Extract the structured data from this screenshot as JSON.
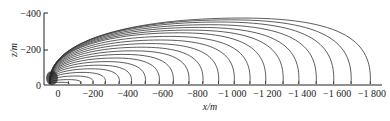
{
  "chart_data": {
    "type": "line",
    "title": "",
    "xlabel": "x/m",
    "ylabel": "z/m",
    "xlim": [
      50,
      -1850
    ],
    "ylim": [
      0,
      -400
    ],
    "x_ticks": [
      "0",
      "−200",
      "−400",
      "−600",
      "−800",
      "−1 000",
      "−1 200",
      "−1 400",
      "−1 600",
      "−1 800"
    ],
    "x_tick_values": [
      0,
      -200,
      -400,
      -600,
      -800,
      -1000,
      -1200,
      -1400,
      -1600,
      -1800
    ],
    "y_ticks": [
      "0",
      "−200",
      "−400"
    ],
    "y_tick_values": [
      0,
      -200,
      -400
    ],
    "grid": false,
    "legend": null,
    "series": [
      {
        "name": "curve-1",
        "end_x": -60,
        "peak_z": -15
      },
      {
        "name": "curve-2",
        "end_x": -130,
        "peak_z": -30
      },
      {
        "name": "curve-3",
        "end_x": -200,
        "peak_z": -50
      },
      {
        "name": "curve-4",
        "end_x": -270,
        "peak_z": -70
      },
      {
        "name": "curve-5",
        "end_x": -350,
        "peak_z": -90
      },
      {
        "name": "curve-6",
        "end_x": -420,
        "peak_z": -110
      },
      {
        "name": "curve-7",
        "end_x": -500,
        "peak_z": -130
      },
      {
        "name": "curve-8",
        "end_x": -580,
        "peak_z": -150
      },
      {
        "name": "curve-9",
        "end_x": -660,
        "peak_z": -170
      },
      {
        "name": "curve-10",
        "end_x": -750,
        "peak_z": -190
      },
      {
        "name": "curve-11",
        "end_x": -830,
        "peak_z": -210
      },
      {
        "name": "curve-12",
        "end_x": -920,
        "peak_z": -230
      },
      {
        "name": "curve-13",
        "end_x": -1010,
        "peak_z": -250
      },
      {
        "name": "curve-14",
        "end_x": -1100,
        "peak_z": -270
      },
      {
        "name": "curve-15",
        "end_x": -1190,
        "peak_z": -290
      },
      {
        "name": "curve-16",
        "end_x": -1290,
        "peak_z": -305
      },
      {
        "name": "curve-17",
        "end_x": -1380,
        "peak_z": -320
      },
      {
        "name": "curve-18",
        "end_x": -1480,
        "peak_z": -335
      },
      {
        "name": "curve-19",
        "end_x": -1580,
        "peak_z": -350
      },
      {
        "name": "curve-20",
        "end_x": -1680,
        "peak_z": -362
      },
      {
        "name": "curve-21",
        "end_x": -1790,
        "peak_z": -372
      }
    ],
    "colors": {
      "line": "#333333",
      "axis": "#222222"
    }
  }
}
